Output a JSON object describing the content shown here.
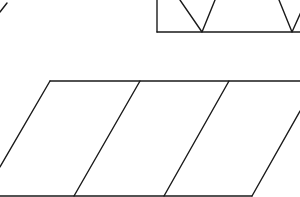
{
  "diagram": {
    "background": "#ffffff",
    "stroke_color": "#1a1a1a",
    "top_left_fragment": {
      "x1": 0,
      "y1": 12,
      "x2": 7,
      "y2": 3
    },
    "top_rectangle": {
      "left_edge": {
        "x1": 157,
        "y1": 0,
        "x2": 157,
        "y2": 32
      },
      "bottom_edge": {
        "x1": 157,
        "y1": 32,
        "x2": 300,
        "y2": 32
      },
      "v_shapes": [
        {
          "points": "180,0 202,32 215,0"
        },
        {
          "points": "279,0 292,32 301,12"
        }
      ]
    },
    "parallelogram_strip": {
      "top_edge": {
        "x1": 50,
        "y1": 81,
        "x2": 300,
        "y2": 81
      },
      "bottom_edge": {
        "x1": 0,
        "y1": 196,
        "x2": 252,
        "y2": 196
      },
      "slanted_edges": [
        {
          "x1": 50,
          "y1": 81,
          "x2": 0,
          "y2": 167
        },
        {
          "x1": 140,
          "y1": 81,
          "x2": 74,
          "y2": 196
        },
        {
          "x1": 229,
          "y1": 81,
          "x2": 164,
          "y2": 196
        },
        {
          "x1": 300,
          "y1": 111,
          "x2": 252,
          "y2": 196
        }
      ]
    }
  }
}
